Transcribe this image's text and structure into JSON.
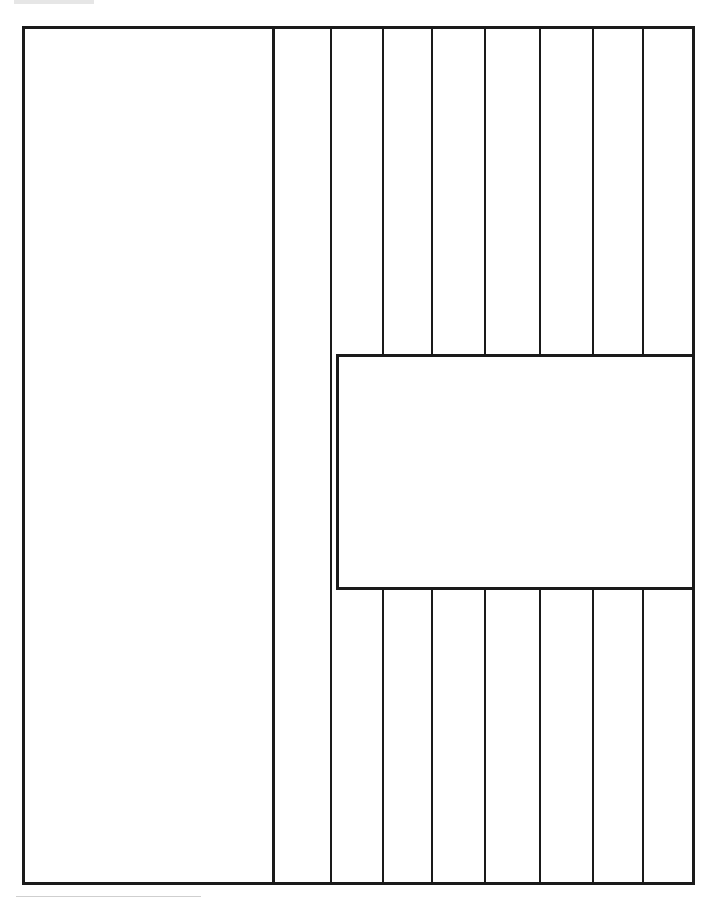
{
  "diagram": {
    "type": "line-drawing",
    "stroke_color": "#1a1a1a",
    "background_color": "#ffffff",
    "outer_frame": {
      "x": 22,
      "y": 26,
      "width": 670,
      "height": 856
    },
    "main_divider_x": 274,
    "strip_lines_x": [
      331,
      383,
      432,
      485,
      540,
      593,
      643
    ],
    "inset_rectangle": {
      "x": 336,
      "y": 354,
      "width": 356,
      "height": 234
    },
    "labels": []
  }
}
